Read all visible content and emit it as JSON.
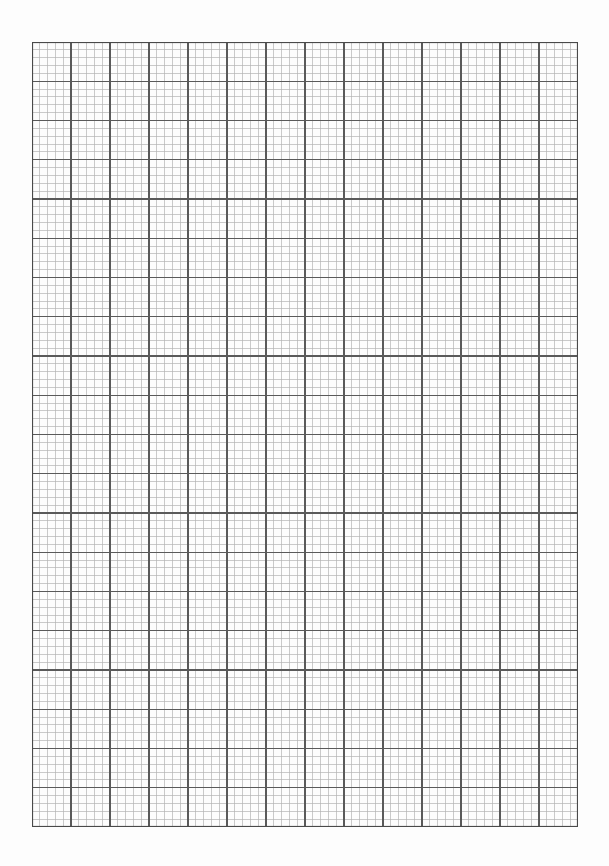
{
  "page": {
    "width": 609,
    "height": 866,
    "background": "#fdfdfd"
  },
  "grid": {
    "left": 32,
    "top": 42,
    "width": 546,
    "height": 785,
    "major_columns": 14,
    "major_rows": 20,
    "minor_per_major": 5,
    "major_line_color": "#5a5a5a",
    "minor_line_color": "#b4b4b4",
    "border_color": "#4a4a4a",
    "major_line_width": 1.1,
    "minor_line_width": 0.7
  }
}
